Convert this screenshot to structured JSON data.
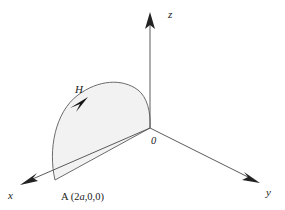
{
  "diagram": {
    "background_color": "#ffffff",
    "axis_color": "#5a5a5a",
    "curve_color": "#6b6b6b",
    "fill_color": "#f2f2f2",
    "label_color": "#1a1a1a",
    "axes": [
      {
        "name": "z-axis",
        "label": "z",
        "label_x": 168,
        "label_y": 18,
        "from": [
          150,
          128
        ],
        "to": [
          150,
          13
        ],
        "arrow": "up"
      },
      {
        "name": "y-axis",
        "label": "y",
        "label_x": 268,
        "label_y": 194,
        "from": [
          150,
          128
        ],
        "to": [
          258,
          182
        ],
        "arrow": "down-right"
      },
      {
        "name": "x-axis",
        "label": "x",
        "label_x": 10,
        "label_y": 198,
        "from": [
          150,
          128
        ],
        "to": [
          22,
          184
        ],
        "arrow": "down-left"
      }
    ],
    "origin": {
      "label": "0",
      "x": 150,
      "y": 128,
      "label_x": 152,
      "label_y": 143
    },
    "point_a": {
      "label_prefix": "A (2",
      "label_italic": "a",
      "label_suffix": ",0,0)",
      "label_full": "A (2a,0,0)",
      "x": 55,
      "y": 180,
      "label_x": 62,
      "label_y": 199
    },
    "curve": {
      "name": "H",
      "label": "H",
      "label_x": 76,
      "label_y": 92,
      "description": "closed oriented loop from A(2a,0,0) to origin, bulging upward",
      "orientation": "counterclockwise-from-A-toward-apex",
      "arrow_tip": [
        88,
        97
      ],
      "arrow_angle_deg": -52
    }
  }
}
